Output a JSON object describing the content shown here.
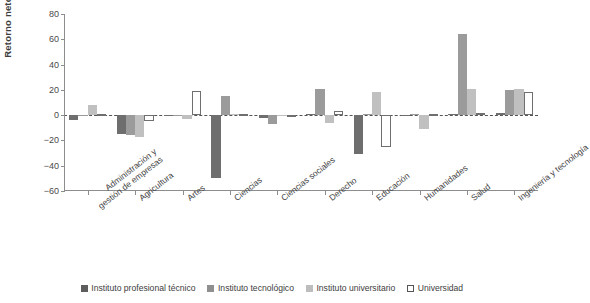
{
  "chart_data": {
    "type": "bar",
    "title": "",
    "subtitle": "",
    "xlabel": "",
    "ylabel": "Retorno neto",
    "ylim": [
      -60,
      80
    ],
    "yticks": [
      80,
      60,
      40,
      20,
      0,
      -20,
      -40,
      -60
    ],
    "grid": false,
    "zero_line": true,
    "legend_position": "bottom",
    "orientation": "vertical",
    "categories": [
      "Administración y gestión de empresas",
      "Agricultura",
      "Artes",
      "Ciencias",
      "Ciencias sociales",
      "Derecho",
      "Educación",
      "Humanidades",
      "Salud",
      "Ingeniería y tecnología"
    ],
    "category_lines": [
      [
        "Administración y",
        "gestión de empresas"
      ],
      [
        "Agricultura"
      ],
      [
        "Artes"
      ],
      [
        "Ciencias"
      ],
      [
        "Ciencias sociales"
      ],
      [
        "Derecho"
      ],
      [
        "Educación"
      ],
      [
        "Humanidades"
      ],
      [
        "Salud"
      ],
      [
        "Ingeniería y tecnología"
      ]
    ],
    "series": [
      {
        "name": "Instituto profesional técnico",
        "color": "#6e6e6e",
        "values": [
          -4,
          -15,
          -1,
          -50,
          -2,
          0,
          -31,
          -1,
          0,
          2
        ]
      },
      {
        "name": "Instituto tecnológico",
        "color": "#9b9b9b",
        "values": [
          -1,
          -16,
          -1,
          15,
          -7,
          21,
          0,
          0,
          64,
          20
        ]
      },
      {
        "name": "Instituto universitario",
        "color": "#c0c0c0",
        "values": [
          8,
          -17,
          -3,
          0,
          -1,
          -6,
          18,
          -11,
          21,
          21
        ]
      },
      {
        "name": "Universidad",
        "color": "#ffffff",
        "values": [
          0,
          -5,
          19,
          0,
          -1,
          3,
          -25,
          0,
          2,
          18
        ]
      }
    ]
  },
  "legend": {
    "items": [
      {
        "label": "Instituto profesional técnico",
        "swatch": "dark-gray-filled"
      },
      {
        "label": "Instituto tecnológico",
        "swatch": "medium-gray-filled"
      },
      {
        "label": "Instituto universitario",
        "swatch": "light-gray-filled"
      },
      {
        "label": "Universidad",
        "swatch": "white-outlined"
      }
    ]
  }
}
